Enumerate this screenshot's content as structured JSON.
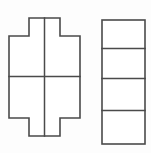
{
  "page": {
    "background_color": "#fdfdfd",
    "width": 151,
    "height": 153
  },
  "style": {
    "line_color": "#4a4a4a",
    "fill_color": "#ffffff",
    "stroke_width": 1.6
  },
  "figures": [
    {
      "id": "cross-figure",
      "name": "cross-shape",
      "type": "polygon",
      "description": "plus/cross shaped outline divided into four quadrants",
      "outline_points": "29,18 60,18 60,36 80,36 80,118 60,118 60,136 29,136 29,118 9,118 9,36 29,36",
      "dividers": [
        {
          "name": "vertical-divider",
          "x1": 44.5,
          "y1": 18,
          "x2": 44.5,
          "y2": 136
        },
        {
          "name": "horizontal-divider",
          "x1": 9,
          "y1": 76.5,
          "x2": 80,
          "y2": 76.5
        }
      ]
    },
    {
      "id": "rectangle-figure",
      "name": "divided-rectangle-shape",
      "type": "rectangle",
      "description": "tall rectangle divided into four horizontal bands",
      "x": 102,
      "y": 20,
      "width": 43,
      "height": 124,
      "dividers": [
        {
          "name": "band-divider-1",
          "x1": 102,
          "y1": 48.5,
          "x2": 145,
          "y2": 48.5
        },
        {
          "name": "band-divider-2",
          "x1": 102,
          "y1": 78.5,
          "x2": 145,
          "y2": 78.5
        },
        {
          "name": "band-divider-3",
          "x1": 102,
          "y1": 110.5,
          "x2": 145,
          "y2": 110.5
        }
      ]
    }
  ]
}
